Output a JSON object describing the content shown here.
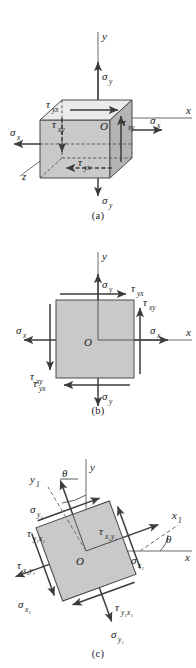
{
  "figure": {
    "colors": {
      "background": "#ffffff",
      "face_front": "#c9c9c9",
      "face_right": "#b4b4b4",
      "face_top": "#ebebeb",
      "square_fill": "#c9c9c9",
      "line": "#3b3b3b",
      "axis": "#555555",
      "text": "#1a1a1a"
    }
  },
  "panels": [
    {
      "id": "a",
      "caption": "(a)",
      "type": "three-dimensional-cube-element",
      "axes": [
        {
          "name": "y-axis",
          "label": "y"
        },
        {
          "name": "x-axis",
          "label": "x"
        },
        {
          "name": "z-axis",
          "label": "z"
        }
      ],
      "origin_label": "O",
      "stress_labels": [
        {
          "name": "sigma-y-top",
          "text": "σ",
          "sub": "y",
          "direction": "up"
        },
        {
          "name": "sigma-y-bottom",
          "text": "σ",
          "sub": "y",
          "direction": "down"
        },
        {
          "name": "sigma-x-left",
          "text": "σ",
          "sub": "x",
          "direction": "left"
        },
        {
          "name": "sigma-x-right",
          "text": "σ",
          "sub": "x",
          "direction": "right"
        },
        {
          "name": "tau-yx-top",
          "text": "τ",
          "sub": "yx",
          "direction": "right"
        },
        {
          "name": "tau-yx-bottom",
          "text": "τ",
          "sub": "yx",
          "direction": "left"
        },
        {
          "name": "tau-xy-left",
          "text": "τ",
          "sub": "xy",
          "direction": "down"
        },
        {
          "name": "tau-xy-right",
          "text": "τ",
          "sub": "xy",
          "direction": "up"
        }
      ]
    },
    {
      "id": "b",
      "caption": "(b)",
      "type": "two-dimensional-square-element",
      "axes": [
        {
          "name": "y-axis",
          "label": "y"
        },
        {
          "name": "x-axis",
          "label": "x"
        }
      ],
      "origin_label": "O",
      "stress_labels": [
        {
          "name": "sigma-y-top",
          "text": "σ",
          "sub": "y",
          "direction": "up"
        },
        {
          "name": "sigma-y-bottom",
          "text": "σ",
          "sub": "y",
          "direction": "down"
        },
        {
          "name": "sigma-x-left",
          "text": "σ",
          "sub": "x",
          "direction": "left"
        },
        {
          "name": "sigma-x-right",
          "text": "σ",
          "sub": "x",
          "direction": "right"
        },
        {
          "name": "tau-yx-top",
          "text": "τ",
          "sub": "yx",
          "direction": "right"
        },
        {
          "name": "tau-yx-bottom",
          "text": "τ",
          "sub": "yx",
          "direction": "left"
        },
        {
          "name": "tau-xy-left",
          "text": "τ",
          "sub": "xy",
          "direction": "down"
        },
        {
          "name": "tau-xy-right",
          "text": "τ",
          "sub": "xy",
          "direction": "up"
        }
      ]
    },
    {
      "id": "c",
      "caption": "(c)",
      "type": "rotated-square-element",
      "rotation_deg": 20,
      "axes": [
        {
          "name": "y-axis",
          "label": "y"
        },
        {
          "name": "x-axis",
          "label": "x"
        },
        {
          "name": "x1-axis",
          "label": "x",
          "sub": "1"
        },
        {
          "name": "y1-axis",
          "label": "y",
          "sub": "1"
        }
      ],
      "angle_labels": [
        {
          "name": "theta-from-y",
          "text": "θ"
        },
        {
          "name": "theta-from-x",
          "text": "θ"
        }
      ],
      "origin_label": "O",
      "stress_labels": [
        {
          "name": "sigma-y1-upper",
          "text": "σ",
          "sub": "y₁",
          "direction": "up-left"
        },
        {
          "name": "sigma-y1-lower",
          "text": "σ",
          "sub": "y₁",
          "direction": "down-right"
        },
        {
          "name": "sigma-x1-right",
          "text": "σ",
          "sub": "x₁",
          "direction": "up-right"
        },
        {
          "name": "sigma-x1-left",
          "text": "σ",
          "sub": "x₁",
          "direction": "down-left"
        },
        {
          "name": "tau-y1x1-upper",
          "text": "τ",
          "sub": "y₁x₁",
          "direction": "up-right"
        },
        {
          "name": "tau-y1x1-lower",
          "text": "τ",
          "sub": "y₁x₁",
          "direction": "down-left"
        },
        {
          "name": "tau-x1y1-right",
          "text": "τ",
          "sub": "x₁y₁",
          "direction": "up-left"
        },
        {
          "name": "tau-x1y1-left",
          "text": "τ",
          "sub": "x₁y₁",
          "direction": "down-right"
        }
      ]
    }
  ],
  "labels": {
    "sigma": "σ",
    "tau": "τ",
    "theta": "θ",
    "x": "x",
    "y": "y",
    "z": "z",
    "origin": "O",
    "sub_x": "x",
    "sub_y": "y",
    "sub_xy": "xy",
    "sub_yx": "yx",
    "sub_one": "1",
    "sub_x1": "x₁",
    "sub_y1": "y₁",
    "sub_x1y1": "x₁y₁",
    "sub_y1x1": "y₁x₁",
    "caption_a": "(a)",
    "caption_b": "(b)",
    "caption_c": "(c)"
  }
}
